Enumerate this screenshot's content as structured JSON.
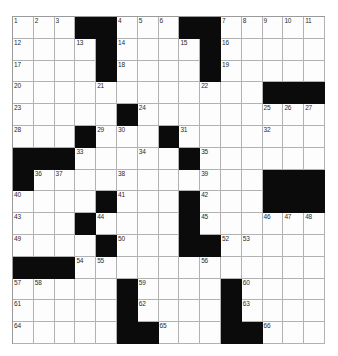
{
  "puzzle": {
    "type": "crossword-grid",
    "rows": 15,
    "cols": 15,
    "colors": {
      "block": "#0b0b0b",
      "cell": "#fdfdfd",
      "gridline": "#b2b2b2",
      "number_text": "#2b2b2b",
      "page_background": "#ffffff"
    },
    "legend": {
      "1": "white cell (fillable)",
      "0": "black block"
    },
    "grid": [
      [
        1,
        1,
        1,
        0,
        0,
        1,
        1,
        1,
        0,
        0,
        1,
        1,
        1,
        1,
        1
      ],
      [
        1,
        1,
        1,
        1,
        0,
        1,
        1,
        1,
        1,
        0,
        1,
        1,
        1,
        1,
        1
      ],
      [
        1,
        1,
        1,
        1,
        0,
        1,
        1,
        1,
        1,
        0,
        1,
        1,
        1,
        1,
        1
      ],
      [
        1,
        1,
        1,
        1,
        1,
        1,
        1,
        1,
        1,
        1,
        1,
        1,
        0,
        0,
        0
      ],
      [
        1,
        1,
        1,
        1,
        1,
        0,
        1,
        1,
        1,
        1,
        1,
        1,
        1,
        1,
        1
      ],
      [
        1,
        1,
        1,
        0,
        1,
        1,
        1,
        0,
        1,
        1,
        1,
        1,
        1,
        1,
        1
      ],
      [
        0,
        0,
        0,
        1,
        1,
        1,
        1,
        1,
        0,
        1,
        1,
        1,
        1,
        1,
        1
      ],
      [
        0,
        1,
        1,
        1,
        1,
        1,
        1,
        1,
        1,
        1,
        1,
        1,
        0,
        0,
        0
      ],
      [
        1,
        1,
        1,
        1,
        0,
        1,
        1,
        1,
        0,
        1,
        1,
        1,
        0,
        0,
        0
      ],
      [
        1,
        1,
        1,
        0,
        1,
        1,
        1,
        1,
        0,
        1,
        1,
        1,
        1,
        1,
        1
      ],
      [
        1,
        1,
        1,
        1,
        0,
        1,
        1,
        1,
        0,
        0,
        1,
        1,
        1,
        1,
        1
      ],
      [
        0,
        0,
        0,
        1,
        1,
        1,
        1,
        1,
        1,
        1,
        1,
        1,
        1,
        1,
        1
      ],
      [
        1,
        1,
        1,
        1,
        1,
        0,
        1,
        1,
        1,
        1,
        0,
        1,
        1,
        1,
        1
      ],
      [
        1,
        1,
        1,
        1,
        1,
        0,
        1,
        1,
        1,
        1,
        0,
        1,
        1,
        1,
        1
      ],
      [
        1,
        1,
        1,
        1,
        1,
        0,
        0,
        1,
        1,
        1,
        0,
        0,
        1,
        1,
        1
      ]
    ],
    "numbers": [
      {
        "row": 0,
        "col": 0,
        "label": "1"
      },
      {
        "row": 0,
        "col": 1,
        "label": "2"
      },
      {
        "row": 0,
        "col": 2,
        "label": "3"
      },
      {
        "row": 0,
        "col": 5,
        "label": "4"
      },
      {
        "row": 0,
        "col": 6,
        "label": "5"
      },
      {
        "row": 0,
        "col": 7,
        "label": "6"
      },
      {
        "row": 0,
        "col": 10,
        "label": "7"
      },
      {
        "row": 0,
        "col": 11,
        "label": "8"
      },
      {
        "row": 0,
        "col": 12,
        "label": "9"
      },
      {
        "row": 0,
        "col": 13,
        "label": "10"
      },
      {
        "row": 0,
        "col": 14,
        "label": "11"
      },
      {
        "row": 1,
        "col": 0,
        "label": "12"
      },
      {
        "row": 1,
        "col": 3,
        "label": "13"
      },
      {
        "row": 1,
        "col": 5,
        "label": "14"
      },
      {
        "row": 1,
        "col": 8,
        "label": "15"
      },
      {
        "row": 1,
        "col": 10,
        "label": "16"
      },
      {
        "row": 2,
        "col": 0,
        "label": "17"
      },
      {
        "row": 2,
        "col": 5,
        "label": "18"
      },
      {
        "row": 2,
        "col": 10,
        "label": "19"
      },
      {
        "row": 3,
        "col": 0,
        "label": "20"
      },
      {
        "row": 3,
        "col": 4,
        "label": "21"
      },
      {
        "row": 3,
        "col": 9,
        "label": "22"
      },
      {
        "row": 4,
        "col": 0,
        "label": "23"
      },
      {
        "row": 4,
        "col": 6,
        "label": "24"
      },
      {
        "row": 4,
        "col": 12,
        "label": "25"
      },
      {
        "row": 4,
        "col": 13,
        "label": "26"
      },
      {
        "row": 4,
        "col": 14,
        "label": "27"
      },
      {
        "row": 5,
        "col": 0,
        "label": "28"
      },
      {
        "row": 5,
        "col": 4,
        "label": "29"
      },
      {
        "row": 5,
        "col": 5,
        "label": "30"
      },
      {
        "row": 5,
        "col": 8,
        "label": "31"
      },
      {
        "row": 5,
        "col": 12,
        "label": "32"
      },
      {
        "row": 6,
        "col": 3,
        "label": "33"
      },
      {
        "row": 6,
        "col": 6,
        "label": "34"
      },
      {
        "row": 6,
        "col": 9,
        "label": "35"
      },
      {
        "row": 7,
        "col": 1,
        "label": "36"
      },
      {
        "row": 7,
        "col": 2,
        "label": "37"
      },
      {
        "row": 7,
        "col": 5,
        "label": "38"
      },
      {
        "row": 7,
        "col": 9,
        "label": "39"
      },
      {
        "row": 8,
        "col": 0,
        "label": "40"
      },
      {
        "row": 8,
        "col": 5,
        "label": "41"
      },
      {
        "row": 8,
        "col": 9,
        "label": "42"
      },
      {
        "row": 9,
        "col": 0,
        "label": "43"
      },
      {
        "row": 9,
        "col": 4,
        "label": "44"
      },
      {
        "row": 9,
        "col": 9,
        "label": "45"
      },
      {
        "row": 9,
        "col": 12,
        "label": "46"
      },
      {
        "row": 9,
        "col": 13,
        "label": "47"
      },
      {
        "row": 9,
        "col": 14,
        "label": "48"
      },
      {
        "row": 10,
        "col": 0,
        "label": "49"
      },
      {
        "row": 10,
        "col": 5,
        "label": "50"
      },
      {
        "row": 10,
        "col": 8,
        "label": "51"
      },
      {
        "row": 10,
        "col": 10,
        "label": "52"
      },
      {
        "row": 10,
        "col": 11,
        "label": "53"
      },
      {
        "row": 11,
        "col": 3,
        "label": "54"
      },
      {
        "row": 11,
        "col": 4,
        "label": "55"
      },
      {
        "row": 11,
        "col": 9,
        "label": "56"
      },
      {
        "row": 12,
        "col": 0,
        "label": "57"
      },
      {
        "row": 12,
        "col": 1,
        "label": "58"
      },
      {
        "row": 12,
        "col": 6,
        "label": "59"
      },
      {
        "row": 12,
        "col": 11,
        "label": "60"
      },
      {
        "row": 13,
        "col": 0,
        "label": "61"
      },
      {
        "row": 13,
        "col": 6,
        "label": "62"
      },
      {
        "row": 13,
        "col": 11,
        "label": "63"
      },
      {
        "row": 14,
        "col": 0,
        "label": "64"
      },
      {
        "row": 14,
        "col": 7,
        "label": "65"
      },
      {
        "row": 14,
        "col": 12,
        "label": "66"
      }
    ]
  }
}
